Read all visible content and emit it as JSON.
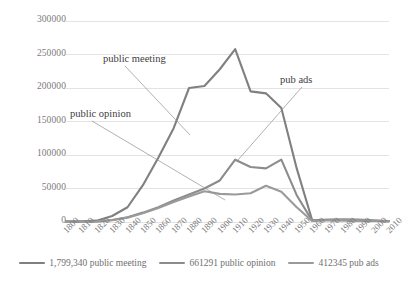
{
  "chart_data": {
    "type": "line",
    "title": "",
    "xlabel": "",
    "ylabel": "",
    "grid": true,
    "legend_position": "bottom",
    "ylim": [
      0,
      300000
    ],
    "yticks": [
      0,
      50000,
      100000,
      150000,
      200000,
      250000,
      300000
    ],
    "ytick_labels": [
      "0",
      "50000",
      "100000",
      "150000",
      "200000",
      "250000",
      "300000"
    ],
    "categories": [
      1800,
      1810,
      1820,
      1830,
      1840,
      1850,
      1860,
      1870,
      1880,
      1890,
      1900,
      1910,
      1920,
      1930,
      1940,
      1950,
      1960,
      1970,
      1980,
      1990,
      2000,
      2010
    ],
    "xtick_labels": [
      "1800",
      "1810",
      "1820",
      "1830",
      "1840",
      "1850",
      "1860",
      "1870",
      "1880",
      "1890",
      "1900",
      "1910",
      "1920",
      "1930",
      "1940",
      "1950",
      "1960",
      "1970",
      "1980",
      "1990",
      "2000",
      "2010"
    ],
    "series": [
      {
        "name": "1,799,340 public meeting",
        "short_name": "public meeting",
        "color": "#808080",
        "values": [
          1000,
          1200,
          2000,
          9000,
          22000,
          55000,
          96000,
          140000,
          200000,
          203000,
          228000,
          258000,
          195000,
          192000,
          170000,
          80000,
          3000,
          2500,
          2200,
          1800,
          1500,
          1200
        ]
      },
      {
        "name": "661291 public opinion",
        "short_name": "public opinion",
        "color": "#8c8c8c",
        "values": [
          300,
          400,
          800,
          3000,
          7000,
          14000,
          22000,
          32000,
          41000,
          50000,
          62000,
          93000,
          82000,
          80000,
          93000,
          40000,
          2000,
          3500,
          4000,
          3500,
          2500,
          1500
        ]
      },
      {
        "name": "412345 pub ads",
        "short_name": "pub ads",
        "color": "#9a9a9a",
        "values": [
          300,
          400,
          700,
          2500,
          6500,
          13000,
          21000,
          30000,
          38000,
          46000,
          42000,
          41000,
          43000,
          54000,
          45000,
          22000,
          1500,
          2500,
          3000,
          2500,
          1800,
          1000
        ]
      }
    ],
    "annotations": [
      {
        "text": "public meeting",
        "label_x": 103,
        "label_y": 53,
        "tip_x": 190,
        "tip_y": 135
      },
      {
        "text": "public opinion",
        "label_x": 70,
        "label_y": 108,
        "tip_x": 225,
        "tip_y": 200
      },
      {
        "text": "pub ads",
        "label_x": 280,
        "label_y": 74,
        "tip_x": 238,
        "tip_y": 160
      }
    ]
  },
  "colors": {
    "grid": "#e3e3e3",
    "axis_text": "#7b7b7b",
    "annotation_text": "#404040",
    "background": "#ffffff"
  }
}
